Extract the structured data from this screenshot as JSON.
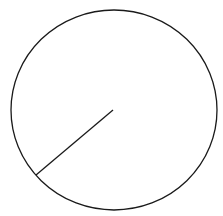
{
  "diagram": {
    "type": "circle-with-radius",
    "stroke_color": "#1a1a1a",
    "background": "#ffffff",
    "circle": {
      "cx": 114,
      "cy": 110,
      "rx": 103,
      "ry": 100
    },
    "radius_line": {
      "x1": 113,
      "y1": 110,
      "x2": 36,
      "y2": 175
    }
  }
}
